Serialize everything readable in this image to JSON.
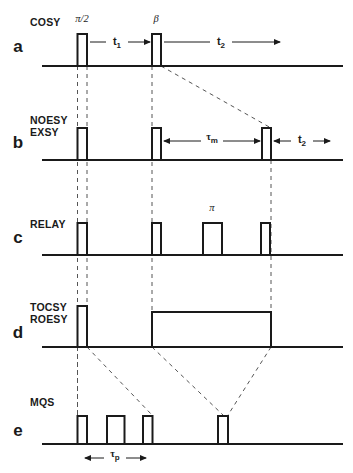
{
  "figure": {
    "width": 353,
    "height": 473,
    "line_color": "#1a1a1a",
    "dash_color": "#555555",
    "background": "#ffffff"
  },
  "rows": [
    {
      "letter": "a",
      "letter_x": 18,
      "letter_y": 52,
      "names": [
        "COSY"
      ],
      "name_x": 30,
      "name_y": 26,
      "baseline_y": 66,
      "pulses": [
        {
          "x": 77.5,
          "w": 9.5,
          "h": 32,
          "label": "π/2",
          "label_x": 82,
          "label_y": 22
        },
        {
          "x": 152,
          "w": 9.0,
          "h": 32,
          "label": "β",
          "label_x": 156,
          "label_y": 22
        }
      ],
      "intervals": [
        {
          "label": "t",
          "sub": "1",
          "x1": 90,
          "x2": 150,
          "y": 42,
          "text_x": 117,
          "text_y": 45
        },
        {
          "label": "t",
          "sub": "2",
          "x1": 164,
          "x2": 280,
          "y": 42,
          "text_x": 221,
          "text_y": 45
        }
      ],
      "spinlock": null
    },
    {
      "letter": "b",
      "letter_x": 18,
      "letter_y": 148,
      "names": [
        "NOESY",
        "EXSY"
      ],
      "name_x": 30,
      "name_y": 124,
      "baseline_y": 160,
      "pulses": [
        {
          "x": 77.5,
          "w": 9.5,
          "h": 32,
          "label": "",
          "label_x": 0,
          "label_y": 0
        },
        {
          "x": 152,
          "w": 9.0,
          "h": 32,
          "label": "",
          "label_x": 0,
          "label_y": 0
        },
        {
          "x": 262,
          "w": 9.0,
          "h": 32,
          "label": "",
          "label_x": 0,
          "label_y": 0
        }
      ],
      "intervals": [
        {
          "label": "τ",
          "sub": "m",
          "x1": 164,
          "x2": 260,
          "y": 141,
          "text_x": 212,
          "text_y": 140
        },
        {
          "label": "t",
          "sub": "2",
          "x1": 274,
          "x2": 330,
          "y": 141,
          "text_x": 302,
          "text_y": 143
        }
      ],
      "spinlock": null
    },
    {
      "letter": "c",
      "letter_x": 18,
      "letter_y": 243,
      "names": [
        "RELAY"
      ],
      "name_x": 30,
      "name_y": 228,
      "baseline_y": 255,
      "pulses": [
        {
          "x": 77.5,
          "w": 9.5,
          "h": 32,
          "label": "",
          "label_x": 0,
          "label_y": 0
        },
        {
          "x": 152,
          "w": 9.0,
          "h": 32,
          "label": "",
          "label_x": 0,
          "label_y": 0
        },
        {
          "x": 203,
          "w": 19.0,
          "h": 32,
          "label": "π",
          "label_x": 212,
          "label_y": 211
        },
        {
          "x": 261,
          "w": 9.0,
          "h": 32,
          "label": "",
          "label_x": 0,
          "label_y": 0
        }
      ],
      "intervals": [],
      "spinlock": null
    },
    {
      "letter": "d",
      "letter_x": 18,
      "letter_y": 338,
      "names": [
        "TOCSY",
        "ROESY"
      ],
      "name_x": 30,
      "name_y": 311,
      "baseline_y": 347,
      "pulses": [
        {
          "x": 77.5,
          "w": 9.5,
          "h": 41,
          "label": "",
          "label_x": 0,
          "label_y": 0
        }
      ],
      "intervals": [],
      "spinlock": {
        "x": 152,
        "w": 119,
        "h": 35
      }
    },
    {
      "letter": "e",
      "letter_x": 18,
      "letter_y": 436,
      "names": [
        "MQS"
      ],
      "name_x": 30,
      "name_y": 406,
      "baseline_y": 444,
      "pulses": [
        {
          "x": 77.5,
          "w": 9.5,
          "h": 28,
          "label": "",
          "label_x": 0,
          "label_y": 0
        },
        {
          "x": 107,
          "w": 17.5,
          "h": 28,
          "label": "",
          "label_x": 0,
          "label_y": 0
        },
        {
          "x": 143,
          "w": 9.5,
          "h": 28,
          "label": "",
          "label_x": 0,
          "label_y": 0
        },
        {
          "x": 218,
          "w": 10.0,
          "h": 28,
          "label": "",
          "label_x": 0,
          "label_y": 0
        }
      ],
      "intervals": [
        {
          "label": "τ",
          "sub": "p",
          "x1": 85,
          "x2": 146,
          "y": 458,
          "text_x": 115,
          "text_y": 457
        }
      ],
      "spinlock": null
    }
  ],
  "baseline_extent": {
    "x_start": 42,
    "x_end": 343
  },
  "dashed_verticals": [
    {
      "x": 77.5,
      "y1": 66,
      "y2": 444
    },
    {
      "x": 87.0,
      "y1": 66,
      "y2": 347
    },
    {
      "x": 152.0,
      "y1": 66,
      "y2": 347
    },
    {
      "x": 271.0,
      "y1": 160,
      "y2": 347
    }
  ],
  "dashed_diagonals": [
    {
      "x1": 161,
      "y1": 66,
      "x2": 271,
      "y2": 128
    },
    {
      "x1": 87,
      "y1": 347,
      "x2": 152,
      "y2": 415
    },
    {
      "x1": 152,
      "y1": 347,
      "x2": 223,
      "y2": 415
    },
    {
      "x1": 271,
      "y1": 347,
      "x2": 228,
      "y2": 415
    },
    {
      "x1": 77.5,
      "y1": 347,
      "x2": 77.5,
      "y2": 415
    }
  ],
  "legend": {
    "letters": [
      "a",
      "b",
      "c",
      "d",
      "e"
    ],
    "sequences": [
      "COSY",
      "NOESY / EXSY",
      "RELAY",
      "TOCSY / ROESY",
      "MQS"
    ],
    "symbols": [
      "π/2",
      "β",
      "π",
      "t₁",
      "t₂",
      "τm",
      "τp"
    ]
  }
}
